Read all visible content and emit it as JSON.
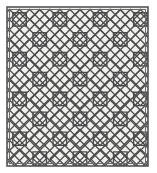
{
  "figure": {
    "width": 157,
    "height": 173
  },
  "colors": {
    "page_background": "#ffffff",
    "panel_fill": "#f0f0ee",
    "line": "#4a4a4a",
    "frame": "#555555",
    "frame_inner": "#6a6a6a"
  },
  "frame": {
    "x": 7,
    "y": 7,
    "width": 141,
    "height": 159,
    "stroke_width": 1.6,
    "inner_inset": 2.5
  },
  "pattern": {
    "type": "diagonal-lattice-with-inscribed-squares",
    "columns": 7,
    "rows": 8,
    "cell_width": 20.14,
    "cell_height": 19.88,
    "origin_x": 9.5,
    "origin_y": 9.5,
    "line_width": 1.3,
    "square_inset_ratio": 0.17,
    "diamond_scale": 1.0
  },
  "labels": {
    "panel_name": "pattern-panel",
    "frame_name": "panel-frame",
    "lattice_name": "lattice-layer",
    "squares_name": "squares-layer",
    "diamonds_name": "diamonds-layer"
  }
}
